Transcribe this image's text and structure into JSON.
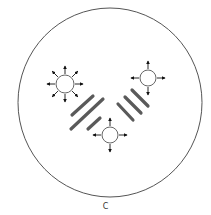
{
  "figure": {
    "caption": "C",
    "colors": {
      "outline": "#555555",
      "arrow": "#111111",
      "band": "#5a5a5a",
      "background": "#ffffff"
    },
    "dish": {
      "cx": 110,
      "cy": 102.5,
      "rx": 92,
      "ry": 94.5
    },
    "sources": [
      {
        "id": "source-top-left",
        "cx": 65,
        "cy": 84,
        "r": 9,
        "arrow_count": 8,
        "arrow_length": 8
      },
      {
        "id": "source-top-right",
        "cx": 148,
        "cy": 78,
        "r": 8,
        "arrow_count": 4,
        "arrow_length": 8
      },
      {
        "id": "source-bottom",
        "cx": 110,
        "cy": 135,
        "r": 8,
        "arrow_count": 4,
        "arrow_length": 8
      }
    ],
    "bands": [
      {
        "id": "band-left-1",
        "x1": 72,
        "y1": 115,
        "x2": 93,
        "y2": 96
      },
      {
        "id": "band-left-2",
        "x1": 71,
        "y1": 129,
        "x2": 103,
        "y2": 99
      },
      {
        "id": "band-left-3",
        "x1": 88,
        "y1": 129,
        "x2": 100,
        "y2": 118
      },
      {
        "id": "band-right-1",
        "x1": 118,
        "y1": 104,
        "x2": 133,
        "y2": 120
      },
      {
        "id": "band-right-2",
        "x1": 125,
        "y1": 97,
        "x2": 141,
        "y2": 113
      },
      {
        "id": "band-right-3",
        "x1": 132,
        "y1": 90,
        "x2": 148,
        "y2": 106
      }
    ]
  }
}
